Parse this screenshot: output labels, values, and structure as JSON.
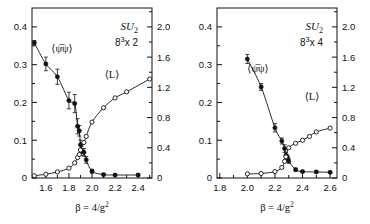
{
  "figure": {
    "background": "#ffffff",
    "ink": "#111111",
    "xlabel": "β = 4/g",
    "xlabel_exp": "2",
    "series_labels": {
      "chiral": "⟨ψ̅ψ⟩",
      "polyakov": "⟨L⟩"
    }
  },
  "panels": [
    {
      "id": "panel-left",
      "title_group": "SU",
      "title_sub": "2",
      "lattice_base": "8",
      "lattice_exp": "3",
      "lattice_rest": "x 2",
      "xlim": [
        1.48,
        2.52
      ],
      "xticks": [
        "1.6",
        "1.8",
        "2.0",
        "2.2",
        "2.4"
      ],
      "xtick_values": [
        1.6,
        1.8,
        2.0,
        2.2,
        2.4
      ],
      "xminor": [
        1.5,
        1.7,
        1.9,
        2.1,
        2.3,
        2.5
      ],
      "ylim_left": [
        0,
        0.45
      ],
      "yticks_left": [
        "0",
        "0.1",
        "0.2",
        "0.3",
        "0.4"
      ],
      "ytick_left_values": [
        0,
        0.1,
        0.2,
        0.3,
        0.4
      ],
      "yminor_left": [
        0.05,
        0.15,
        0.25,
        0.35
      ],
      "ylim_right": [
        0,
        2.25
      ],
      "yticks_right": [
        "0",
        "0.4",
        "0.8",
        "1.2",
        "1.6",
        "2.0"
      ],
      "ytick_right_values": [
        0,
        0.4,
        0.8,
        1.2,
        1.6,
        2.0
      ],
      "yminor_right": [
        0.2,
        0.6,
        1.0,
        1.4,
        1.8,
        2.2
      ]
    },
    {
      "id": "panel-right",
      "title_group": "SU",
      "title_sub": "2",
      "lattice_base": "8",
      "lattice_exp": "3",
      "lattice_rest": "x 4",
      "xlim": [
        1.78,
        2.65
      ],
      "xticks": [
        "1.8",
        "2.0",
        "2.2",
        "2.4",
        "2.6"
      ],
      "xtick_values": [
        1.8,
        2.0,
        2.2,
        2.4,
        2.6
      ],
      "xminor": [
        1.9,
        2.1,
        2.3,
        2.5
      ],
      "ylim_left": [
        0,
        0.45
      ],
      "yticks_left": [
        "0",
        "0.1",
        "0.2",
        "0.3",
        "0.4"
      ],
      "ytick_left_values": [
        0,
        0.1,
        0.2,
        0.3,
        0.4
      ],
      "yminor_left": [
        0.05,
        0.15,
        0.25,
        0.35
      ],
      "ylim_right": [
        0,
        2.25
      ],
      "yticks_right": [
        "0",
        "0.4",
        "0.8",
        "1.2",
        "1.6",
        "2.0"
      ],
      "ytick_right_values": [
        0,
        0.4,
        0.8,
        1.2,
        1.6,
        2.0
      ],
      "yminor_right": [
        0.2,
        0.6,
        1.0,
        1.4,
        1.8,
        2.2
      ]
    }
  ],
  "chart_data": [
    {
      "type": "scatter",
      "panel": "left",
      "title": "SU2  8^3 x 2",
      "xlabel": "β = 4/g^2",
      "ylabel": "⟨ψ̅ψ⟩",
      "ylabel_right": "⟨L⟩",
      "xlim": [
        1.48,
        2.52
      ],
      "ylim": [
        0,
        0.45
      ],
      "ylim_right": [
        0,
        2.25
      ],
      "grid": false,
      "legend": "inline-annotations",
      "series": [
        {
          "name": "⟨ψ̅ψ⟩",
          "axis": "left",
          "marker": "filled-circle",
          "x": [
            1.5,
            1.6,
            1.7,
            1.8,
            1.85,
            1.875,
            1.89,
            1.9,
            1.91,
            1.93,
            1.95,
            2.0,
            2.1,
            2.2,
            2.4
          ],
          "y": [
            0.358,
            0.302,
            0.268,
            0.205,
            0.197,
            0.137,
            0.125,
            0.088,
            0.072,
            0.068,
            0.048,
            0.018,
            0.009,
            0.008,
            0.008
          ],
          "yerr": [
            0.006,
            0.018,
            0.02,
            0.022,
            0.024,
            0.02,
            0.014,
            0.012,
            0.012,
            0.01,
            0.009,
            0.005,
            0.003,
            0.003,
            0.003
          ]
        },
        {
          "name": "⟨L⟩",
          "axis": "right",
          "marker": "open-circle",
          "x": [
            1.5,
            1.6,
            1.7,
            1.8,
            1.85,
            1.875,
            1.89,
            1.9,
            1.93,
            1.95,
            2.0,
            2.1,
            2.2,
            2.3,
            2.5
          ],
          "y": [
            0.03,
            0.05,
            0.08,
            0.13,
            0.2,
            0.27,
            0.31,
            0.37,
            0.47,
            0.55,
            0.74,
            0.93,
            1.06,
            1.14,
            1.31
          ]
        }
      ]
    },
    {
      "type": "scatter",
      "panel": "right",
      "title": "SU2  8^3 x 4",
      "xlabel": "β = 4/g^2",
      "ylabel": "⟨ψ̅ψ⟩",
      "ylabel_right": "⟨L⟩",
      "xlim": [
        1.78,
        2.65
      ],
      "ylim": [
        0,
        0.45
      ],
      "ylim_right": [
        0,
        2.25
      ],
      "grid": false,
      "legend": "inline-annotations",
      "series": [
        {
          "name": "⟨ψ̅ψ⟩",
          "axis": "left",
          "marker": "filled-circle",
          "x": [
            2.0,
            2.1,
            2.2,
            2.25,
            2.27,
            2.28,
            2.29,
            2.3,
            2.35,
            2.4,
            2.5,
            2.6
          ],
          "y": [
            0.315,
            0.241,
            0.133,
            0.098,
            0.078,
            0.06,
            0.055,
            0.045,
            0.022,
            0.017,
            0.016,
            0.015
          ],
          "yerr": [
            0.012,
            0.009,
            0.011,
            0.008,
            0.01,
            0.008,
            0.006,
            0.006,
            0.004,
            0.003,
            0.003,
            0.003
          ]
        },
        {
          "name": "⟨L⟩",
          "axis": "right",
          "marker": "open-circle",
          "x": [
            2.0,
            2.1,
            2.2,
            2.25,
            2.27,
            2.28,
            2.3,
            2.35,
            2.4,
            2.45,
            2.5,
            2.6
          ],
          "y": [
            0.055,
            0.06,
            0.085,
            0.14,
            0.22,
            0.28,
            0.4,
            0.46,
            0.5,
            0.55,
            0.61,
            0.66
          ]
        }
      ]
    }
  ]
}
